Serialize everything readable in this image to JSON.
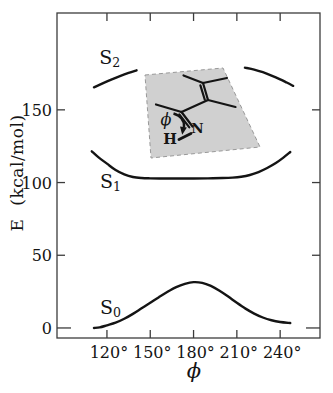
{
  "figure": {
    "background": "#ffffff",
    "frame_color": "#3c3c3c",
    "curve_color": "#141414",
    "text_color": "#141414"
  },
  "chart_data": {
    "type": "line",
    "title": "",
    "xlabel": "ϕ",
    "ylabel_main": "E",
    "ylabel_unit": "(kcal/mol)",
    "x_unit": "degrees",
    "xlim": [
      85.4,
      267.6
    ],
    "ylim": [
      -6.9,
      216.6
    ],
    "grid": false,
    "legend": "inline curve labels",
    "x_ticks": [
      {
        "value": 120,
        "label": "120°"
      },
      {
        "value": 150,
        "label": "150°"
      },
      {
        "value": 180,
        "label": "180°"
      },
      {
        "value": 210,
        "label": "210°"
      },
      {
        "value": 240,
        "label": "240°"
      }
    ],
    "y_ticks": [
      {
        "value": 0,
        "label": "0",
        "long_tick": true
      },
      {
        "value": 50,
        "label": "50",
        "long_tick": false
      },
      {
        "value": 100,
        "label": "100",
        "long_tick": false
      },
      {
        "value": 150,
        "label": "150",
        "long_tick": false
      }
    ],
    "series": [
      {
        "name": "S0",
        "label_main": "S",
        "label_sub": "0",
        "label_pos": {
          "x": 122.5,
          "y": 13.5
        },
        "segments": [
          [
            [
              111,
              0
            ],
            [
              115,
              0.4
            ],
            [
              120,
              1.8
            ],
            [
              126,
              3.6
            ],
            [
              132,
              6.3
            ],
            [
              138,
              9.7
            ],
            [
              144,
              13.5
            ],
            [
              150,
              17.3
            ],
            [
              156,
              21.2
            ],
            [
              162,
              24.9
            ],
            [
              168,
              28.1
            ],
            [
              174,
              30.3
            ],
            [
              180,
              31.5
            ],
            [
              186,
              31.0
            ],
            [
              192,
              28.9
            ],
            [
              198,
              25.6
            ],
            [
              204,
              21.6
            ],
            [
              210,
              17.3
            ],
            [
              216,
              13.3
            ],
            [
              222,
              9.9
            ],
            [
              228,
              7.2
            ],
            [
              234,
              5.3
            ],
            [
              240,
              4.1
            ],
            [
              247,
              3.4
            ]
          ]
        ]
      },
      {
        "name": "S1",
        "label_main": "S",
        "label_sub": "1",
        "label_pos": {
          "x": 122.5,
          "y": 100.5
        },
        "segments": [
          [
            [
              109.5,
              121.5
            ],
            [
              114,
              117.5
            ],
            [
              120,
              113
            ],
            [
              126,
              108.6
            ],
            [
              132,
              105.6
            ],
            [
              138,
              103.8
            ],
            [
              144,
              103.1
            ],
            [
              150,
              102.9
            ],
            [
              160,
              102.8
            ],
            [
              170,
              102.8
            ],
            [
              180,
              102.8
            ],
            [
              190,
              102.9
            ],
            [
              200,
              103.1
            ],
            [
              207,
              103.4
            ],
            [
              213,
              104
            ],
            [
              219,
              105.2
            ],
            [
              225,
              107.2
            ],
            [
              231,
              110
            ],
            [
              237,
              113.4
            ],
            [
              242,
              117
            ],
            [
              247,
              121
            ]
          ]
        ]
      },
      {
        "name": "S2",
        "label_main": "S",
        "label_sub": "2",
        "label_pos": {
          "x": 122,
          "y": 185.5
        },
        "segments": [
          [
            [
              111,
              165.5
            ],
            [
              117,
              168.2
            ],
            [
              123,
              170.8
            ],
            [
              129,
              173.2
            ],
            [
              135,
              175.4
            ],
            [
              140.5,
              177.2
            ]
          ],
          [
            [
              215.6,
              179
            ],
            [
              222,
              177.7
            ],
            [
              228,
              175.9
            ],
            [
              234,
              173.6
            ],
            [
              240,
              171
            ],
            [
              244.5,
              168.8
            ],
            [
              249,
              166.5
            ]
          ]
        ]
      }
    ]
  },
  "inset": {
    "plane_color": "#d0d0d0",
    "plane_edge_color": "#999999",
    "bond_color": "#141414",
    "labels": {
      "phi": "ϕ",
      "nitrogen": "N",
      "hydrogen": "H"
    }
  }
}
